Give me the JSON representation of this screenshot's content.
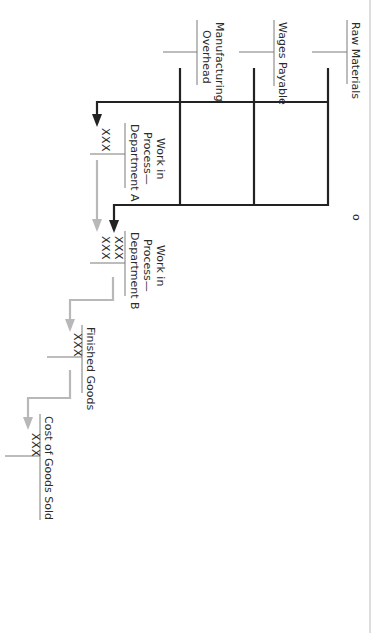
{
  "diagram": {
    "title": "",
    "orientation": "rotated 90 degrees clockwise",
    "colors": {
      "flow_primary": "#222222",
      "flow_secondary": "#b8b8b8",
      "t_account_line": "#7a7a7a",
      "text": "#2a2a2a",
      "page_border": "#cfcfcf"
    },
    "accounts": [
      {
        "id": "raw-materials",
        "name_lines": [
          "Raw Materials"
        ],
        "debits": [],
        "credits": []
      },
      {
        "id": "wages-payable",
        "name_lines": [
          "Wages Payable"
        ],
        "debits": [],
        "credits": []
      },
      {
        "id": "manufacturing-overhead",
        "name_lines": [
          "Manufacturing",
          "Overhead"
        ],
        "debits": [],
        "credits": []
      },
      {
        "id": "wip-dept-a",
        "name_lines": [
          "Work in",
          "Process—",
          "Department A"
        ],
        "debits": [
          "XXX"
        ],
        "credits": []
      },
      {
        "id": "wip-dept-b",
        "name_lines": [
          "Work in",
          "Process—",
          "Department B"
        ],
        "debits": [
          "XXX",
          "XXX"
        ],
        "credits": []
      },
      {
        "id": "finished-goods",
        "name_lines": [
          "Finished Goods"
        ],
        "debits": [
          "XXX"
        ],
        "credits": []
      },
      {
        "id": "cogs",
        "name_lines": [
          "Cost of Goods Sold"
        ],
        "debits": [
          "XXX"
        ],
        "credits": []
      }
    ],
    "flows": [
      {
        "from": [
          "raw-materials",
          "wages-payable",
          "manufacturing-overhead"
        ],
        "to": "wip-dept-a",
        "style": "primary"
      },
      {
        "from": [
          "raw-materials",
          "wages-payable",
          "manufacturing-overhead"
        ],
        "to": "wip-dept-b",
        "style": "primary"
      },
      {
        "from": "wip-dept-a",
        "to": "wip-dept-b",
        "style": "secondary"
      },
      {
        "from": "wip-dept-b",
        "to": "finished-goods",
        "style": "secondary"
      },
      {
        "from": "finished-goods",
        "to": "cogs",
        "style": "secondary"
      }
    ],
    "page_mark": "o"
  }
}
